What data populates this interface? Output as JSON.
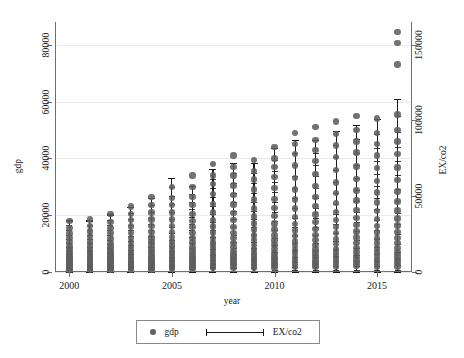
{
  "chart_data": {
    "type": "scatter",
    "title": "",
    "xlabel": "year",
    "ylabel": "gdp",
    "y2label": "EX/co2",
    "xlim": [
      1999.3,
      2016.7
    ],
    "ylim": [
      0,
      88000
    ],
    "y2lim": [
      0,
      165000
    ],
    "grid": true,
    "legend_position": "bottom-center",
    "x_ticks": [
      2000,
      2005,
      2010,
      2015
    ],
    "x_tick_labels": [
      "2000",
      "2005",
      "2010",
      "2015"
    ],
    "y_ticks": [
      0,
      20000,
      40000,
      60000,
      80000
    ],
    "y_tick_labels": [
      "0",
      "20000",
      "40000",
      "60000",
      "80000"
    ],
    "y2_ticks": [
      0,
      50000,
      100000,
      150000
    ],
    "y2_tick_labels": [
      "0",
      "50000",
      "100000",
      "150000"
    ],
    "legend": [
      {
        "label": "gdp",
        "marker": "circle",
        "color": "#646464"
      },
      {
        "label": "EX/co2",
        "marker": "errorbar",
        "color": "#1a1a1a"
      }
    ],
    "categories": [
      2000,
      2001,
      2002,
      2003,
      2004,
      2005,
      2006,
      2007,
      2008,
      2009,
      2010,
      2011,
      2012,
      2013,
      2014,
      2015,
      2016
    ],
    "series": [
      {
        "name": "EX/co2",
        "axis": "right",
        "type": "errorbar",
        "low": [
          0,
          0,
          0,
          0,
          0,
          0,
          0,
          0,
          0,
          0,
          0,
          0,
          0,
          0,
          0,
          0,
          0
        ],
        "high": [
          34000,
          34000,
          38000,
          43000,
          49000,
          62000,
          57000,
          68000,
          72000,
          72000,
          82000,
          87000,
          87000,
          93000,
          97000,
          101000,
          114000
        ]
      },
      {
        "name": "gdp",
        "axis": "left",
        "type": "scatter",
        "points": [
          {
            "year": 2000,
            "values": [
              700,
              1100,
              1500,
              1900,
              2300,
              2800,
              3200,
              3800,
              4400,
              5000,
              5600,
              6300,
              7100,
              8000,
              9000,
              10500,
              12000,
              13500,
              15500,
              18000
            ]
          },
          {
            "year": 2001,
            "values": [
              700,
              1100,
              1500,
              1900,
              2300,
              2800,
              3200,
              3800,
              4400,
              5000,
              5600,
              6300,
              7200,
              8200,
              9300,
              10800,
              12500,
              14200,
              16200,
              18500
            ]
          },
          {
            "year": 2002,
            "values": [
              750,
              1200,
              1600,
              2000,
              2500,
              3000,
              3500,
              4000,
              4700,
              5400,
              6100,
              6900,
              7900,
              9000,
              10200,
              11800,
              13800,
              15500,
              17500,
              20500
            ]
          },
          {
            "year": 2003,
            "values": [
              800,
              1300,
              1700,
              2200,
              2700,
              3300,
              3900,
              4500,
              5300,
              6100,
              7000,
              8000,
              9100,
              10500,
              12000,
              13800,
              16000,
              18200,
              20500,
              23000
            ]
          },
          {
            "year": 2004,
            "values": [
              900,
              1400,
              1900,
              2500,
              3100,
              3700,
              4400,
              5200,
              6000,
              7000,
              8100,
              9300,
              10700,
              12200,
              14000,
              16200,
              18500,
              21000,
              23500,
              26500
            ]
          },
          {
            "year": 2005,
            "values": [
              1000,
              1600,
              2200,
              2800,
              3500,
              4200,
              5000,
              5900,
              6900,
              8000,
              9300,
              10700,
              12300,
              14100,
              16100,
              18500,
              21000,
              23500,
              26000,
              30000
            ]
          },
          {
            "year": 2006,
            "values": [
              1100,
              1800,
              2400,
              3100,
              3900,
              4700,
              5600,
              6600,
              7700,
              8900,
              10400,
              12000,
              13800,
              15800,
              18000,
              20500,
              23500,
              26500,
              30000,
              34000
            ]
          },
          {
            "year": 2007,
            "values": [
              1300,
              2000,
              2800,
              3600,
              4500,
              5500,
              6500,
              7700,
              9000,
              10400,
              12000,
              13900,
              16000,
              18300,
              21000,
              24000,
              27500,
              31000,
              34000,
              38000
            ]
          },
          {
            "year": 2008,
            "values": [
              1500,
              2400,
              3200,
              4100,
              5100,
              6200,
              7400,
              8800,
              10300,
              11900,
              13700,
              15800,
              18200,
              20800,
              23800,
              27000,
              30500,
              34000,
              37000,
              41000
            ]
          },
          {
            "year": 2009,
            "values": [
              1400,
              2200,
              3000,
              3800,
              4800,
              5800,
              7000,
              8200,
              9600,
              11200,
              12900,
              14900,
              17100,
              19600,
              22400,
              25500,
              29000,
              32500,
              35500,
              39500
            ]
          },
          {
            "year": 2010,
            "values": [
              1600,
              2500,
              3400,
              4400,
              5500,
              6700,
              8000,
              9500,
              11100,
              12900,
              14900,
              17100,
              19700,
              22500,
              25700,
              29500,
              33500,
              37000,
              40000,
              44000
            ]
          },
          {
            "year": 2011,
            "values": [
              1800,
              2900,
              3900,
              5000,
              6300,
              7600,
              9100,
              10800,
              12600,
              14600,
              16900,
              19400,
              22300,
              25500,
              29000,
              33000,
              37500,
              41500,
              45000,
              49000
            ]
          },
          {
            "year": 2012,
            "values": [
              1900,
              3000,
              4000,
              5200,
              6500,
              7900,
              9500,
              11200,
              13100,
              15200,
              17600,
              20200,
              23200,
              26500,
              30200,
              34500,
              39000,
              43000,
              46500,
              51000
            ]
          },
          {
            "year": 2013,
            "values": [
              2000,
              3100,
              4200,
              5400,
              6800,
              8200,
              9900,
              11700,
              13700,
              15900,
              18400,
              21100,
              24200,
              27700,
              31500,
              36000,
              40500,
              44500,
              48500,
              53000
            ]
          },
          {
            "year": 2014,
            "values": [
              2100,
              3200,
              4400,
              5600,
              7000,
              8500,
              10200,
              12100,
              14200,
              16500,
              19000,
              21900,
              25100,
              28700,
              32700,
              37200,
              42000,
              46000,
              50000,
              55000
            ]
          },
          {
            "year": 2015,
            "values": [
              2000,
              3100,
              4200,
              5400,
              6800,
              8300,
              10000,
              11800,
              13900,
              16100,
              18600,
              21400,
              24500,
              28000,
              32000,
              36500,
              41000,
              45000,
              49000,
              54000
            ]
          },
          {
            "year": 2016,
            "values": [
              2000,
              3100,
              4300,
              5500,
              6900,
              8400,
              10100,
              12000,
              14000,
              16300,
              18800,
              21600,
              24800,
              28300,
              32300,
              36800,
              41500,
              46000,
              50000,
              55500,
              73000,
              80500,
              84500
            ]
          }
        ]
      }
    ]
  },
  "axes": {
    "left_title": "gdp",
    "right_title": "EX/co2",
    "bottom_title": "year"
  }
}
